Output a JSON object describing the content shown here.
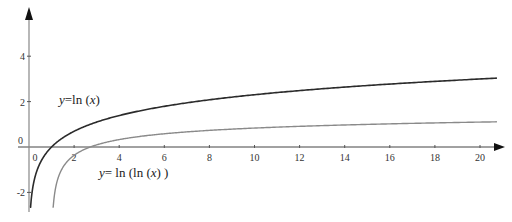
{
  "chart_data": {
    "type": "line",
    "title": "",
    "xlabel": "",
    "ylabel": "",
    "xlim": [
      -1.2,
      21.2
    ],
    "ylim": [
      -2.6,
      6.5
    ],
    "grid": false,
    "legend": "none (inline curve labels)",
    "x_ticks": [
      0,
      2,
      4,
      6,
      8,
      10,
      12,
      14,
      16,
      18,
      20
    ],
    "x_tick_labels": [
      "0",
      "2",
      "4",
      "6",
      "8",
      "10",
      "12",
      "14",
      "16",
      "18",
      "20"
    ],
    "y_ticks": [
      -2,
      0,
      2,
      4
    ],
    "y_tick_labels": [
      "-2",
      "0",
      "2",
      "4"
    ],
    "series": [
      {
        "name": "y=ln (x)",
        "label_parts": [
          "y",
          "=ln (",
          "x",
          ")"
        ],
        "function": "ln(x)",
        "color": "#2b2b2b",
        "x_range": [
          0.04,
          20.75
        ],
        "x": [
          0.05,
          0.1,
          0.25,
          0.5,
          1,
          2,
          4,
          6,
          8,
          10,
          12,
          14,
          16,
          18,
          20
        ],
        "values": [
          -3.0,
          -2.3,
          -1.39,
          -0.69,
          0,
          0.69,
          1.39,
          1.79,
          2.08,
          2.3,
          2.48,
          2.64,
          2.77,
          2.89,
          3.0
        ]
      },
      {
        "name": "y= ln (ln (x) )",
        "label_parts": [
          "y",
          "= ln (ln (",
          "x",
          ") )"
        ],
        "function": "ln(ln(x))",
        "color": "#8a8a8a",
        "x_range": [
          1.04,
          20.75
        ],
        "x": [
          1.1,
          1.5,
          2,
          2.718,
          4,
          6,
          8,
          10,
          12,
          14,
          16,
          18,
          20
        ],
        "values": [
          -2.35,
          -0.9,
          -0.37,
          0,
          0.33,
          0.58,
          0.73,
          0.83,
          0.91,
          0.97,
          1.02,
          1.06,
          1.1
        ]
      }
    ]
  },
  "labels": {
    "lnx_y": "y",
    "lnx_mid": "=ln (",
    "lnx_x": "x",
    "lnx_end": ")",
    "lnlnx_y": "y",
    "lnlnx_mid": "= ln (ln (",
    "lnlnx_x": "x",
    "lnlnx_end": ") )"
  }
}
